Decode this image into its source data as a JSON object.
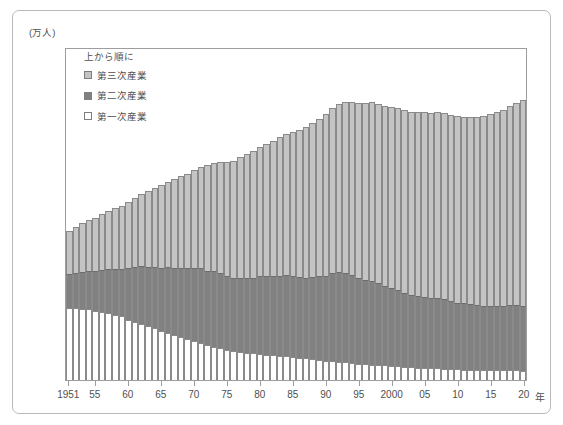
{
  "figure": {
    "unit_label": "(万人)",
    "x_unit_suffix": "年"
  },
  "legend": {
    "title": "上から順に",
    "items": [
      {
        "label": "第三次産業",
        "swatch": "tertiary",
        "color": "#c4c4c4"
      },
      {
        "label": "第二次産業",
        "swatch": "secondary",
        "color": "#818181"
      },
      {
        "label": "第一次産業",
        "swatch": "primary",
        "color": "#ffffff"
      }
    ]
  },
  "chart_data": {
    "type": "bar",
    "stacked": true,
    "title": "",
    "subtitle": "",
    "xlabel": "年",
    "ylabel": "(万人)",
    "ylim": [
      0,
      8000
    ],
    "ytick_labels": [
      "0",
      "1,000",
      "2,000",
      "3,000",
      "4,000",
      "5,000",
      "6,000",
      "7,000",
      "8,000"
    ],
    "ytick_values": [
      0,
      1000,
      2000,
      3000,
      4000,
      5000,
      6000,
      7000,
      8000
    ],
    "xtick_labels": [
      "1951",
      "55",
      "60",
      "65",
      "70",
      "75",
      "80",
      "85",
      "90",
      "95",
      "2000",
      "05",
      "10",
      "15",
      "20"
    ],
    "xtick_years": [
      1951,
      1955,
      1960,
      1965,
      1970,
      1975,
      1980,
      1985,
      1990,
      1995,
      2000,
      2005,
      2010,
      2015,
      2020
    ],
    "grid": false,
    "legend_position": "inside-top-left",
    "x": [
      1951,
      1952,
      1953,
      1954,
      1955,
      1956,
      1957,
      1958,
      1959,
      1960,
      1961,
      1962,
      1963,
      1964,
      1965,
      1966,
      1967,
      1968,
      1969,
      1970,
      1971,
      1972,
      1973,
      1974,
      1975,
      1976,
      1977,
      1978,
      1979,
      1980,
      1981,
      1982,
      1983,
      1984,
      1985,
      1986,
      1987,
      1988,
      1989,
      1990,
      1991,
      1992,
      1993,
      1994,
      1995,
      1996,
      1997,
      1998,
      1999,
      2000,
      2001,
      2002,
      2003,
      2004,
      2005,
      2006,
      2007,
      2008,
      2009,
      2010,
      2011,
      2012,
      2013,
      2014,
      2015,
      2016,
      2017,
      2018,
      2019,
      2020
    ],
    "series": [
      {
        "name": "第一次産業",
        "color": "#ffffff",
        "stack_order": 3,
        "values": [
          1730,
          1720,
          1700,
          1700,
          1660,
          1630,
          1600,
          1570,
          1530,
          1450,
          1400,
          1350,
          1290,
          1250,
          1180,
          1130,
          1080,
          1040,
          990,
          930,
          890,
          850,
          800,
          760,
          730,
          700,
          680,
          660,
          640,
          620,
          600,
          590,
          580,
          570,
          550,
          540,
          520,
          500,
          480,
          460,
          450,
          440,
          430,
          420,
          390,
          380,
          370,
          360,
          350,
          340,
          330,
          320,
          310,
          300,
          290,
          280,
          280,
          270,
          260,
          260,
          250,
          250,
          240,
          230,
          230,
          230,
          230,
          230,
          230,
          210
        ]
      },
      {
        "name": "第二次産業",
        "color": "#818181",
        "stack_order": 2,
        "values": [
          810,
          860,
          900,
          920,
          950,
          1010,
          1070,
          1100,
          1140,
          1230,
          1310,
          1380,
          1430,
          1470,
          1520,
          1580,
          1620,
          1660,
          1700,
          1760,
          1790,
          1780,
          1810,
          1810,
          1760,
          1760,
          1780,
          1790,
          1820,
          1870,
          1900,
          1910,
          1930,
          1950,
          1950,
          1940,
          1940,
          1970,
          2010,
          2050,
          2120,
          2160,
          2150,
          2110,
          2060,
          2030,
          2020,
          1960,
          1900,
          1870,
          1830,
          1780,
          1730,
          1710,
          1700,
          1680,
          1690,
          1680,
          1630,
          1600,
          1590,
          1580,
          1560,
          1550,
          1540,
          1550,
          1560,
          1570,
          1580,
          1570
        ]
      },
      {
        "name": "第三次産業",
        "color": "#c4c4c4",
        "stack_order": 1,
        "values": [
          1030,
          1100,
          1180,
          1230,
          1280,
          1340,
          1400,
          1460,
          1520,
          1590,
          1670,
          1740,
          1820,
          1900,
          1980,
          2050,
          2120,
          2190,
          2270,
          2350,
          2450,
          2530,
          2610,
          2660,
          2740,
          2810,
          2890,
          2970,
          3050,
          3110,
          3180,
          3250,
          3340,
          3390,
          3460,
          3530,
          3610,
          3700,
          3790,
          3880,
          3960,
          4030,
          4100,
          4160,
          4200,
          4250,
          4300,
          4320,
          4330,
          4350,
          4380,
          4390,
          4400,
          4420,
          4440,
          4460,
          4480,
          4470,
          4470,
          4490,
          4480,
          4480,
          4530,
          4560,
          4620,
          4660,
          4700,
          4790,
          4850,
          4940
        ]
      }
    ],
    "totals": [
      3570,
      3680,
      3780,
      3850,
      3890,
      3980,
      4070,
      4130,
      4190,
      4270,
      4380,
      4470,
      4540,
      4620,
      4680,
      4760,
      4820,
      4890,
      4960,
      5040,
      5130,
      5160,
      5220,
      5230,
      5230,
      5270,
      5350,
      5420,
      5510,
      5600,
      5680,
      5750,
      5850,
      5910,
      5960,
      6010,
      6070,
      6170,
      6280,
      6390,
      6530,
      6630,
      6680,
      6690,
      6650,
      6660,
      6690,
      6640,
      6580,
      6560,
      6540,
      6490,
      6440,
      6430,
      6430,
      6420,
      6450,
      6420,
      6360,
      6350,
      6320,
      6310,
      6330,
      6340,
      6390,
      6440,
      6490,
      6590,
      6660,
      6720
    ]
  }
}
